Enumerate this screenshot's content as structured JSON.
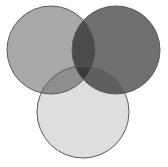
{
  "diagram": {
    "type": "venn",
    "sets": 3,
    "labels": [],
    "background": "#ffffff",
    "outline_color": "#5a5a5a",
    "circles": [
      {
        "id": "A",
        "position": "top-left",
        "cx": 51,
        "cy": 50,
        "r": 44,
        "fill": "#a9a9a9"
      },
      {
        "id": "B",
        "position": "top-right",
        "cx": 116,
        "cy": 50,
        "r": 44,
        "fill": "#6f6f6f"
      },
      {
        "id": "C",
        "position": "bottom",
        "cx": 83,
        "cy": 112,
        "r": 46,
        "fill": "#dedede"
      }
    ],
    "regions": {
      "A_only": "#a9a9a9",
      "B_only": "#6f6f6f",
      "C_only": "#dedede",
      "A_and_B": "#4b4b4b",
      "A_and_C": "#8e8e8e",
      "B_and_C": "#5f5f5f",
      "A_and_B_and_C": "#3a3a3a"
    }
  }
}
